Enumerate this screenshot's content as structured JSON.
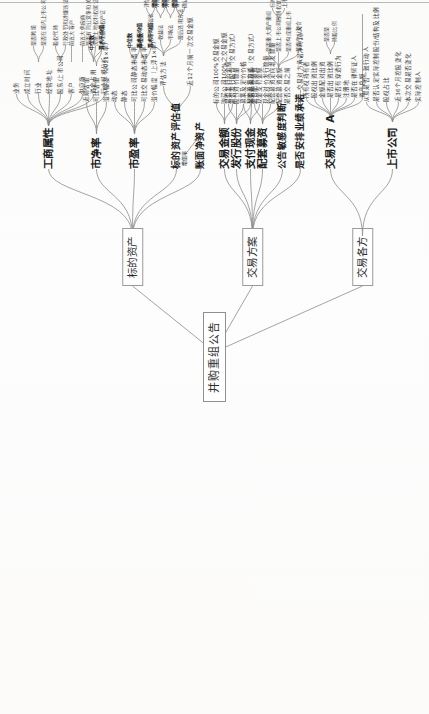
{
  "meta": {
    "orientation": "rotated-90-ccw",
    "stroke_color": "#8d8d8d",
    "text_color": "#2c2c2c",
    "background": "#fdfdfc"
  },
  "root": {
    "label": "并购重组公告"
  },
  "branches": [
    {
      "id": "biaodi",
      "label": "标的资产",
      "children": [
        {
          "label": "工商属性",
          "children": [
            {
              "label": "业务",
              "children": []
            },
            {
              "label": "成立时间",
              "children": []
            },
            {
              "label": "行业",
              "children": [
                {
                  "label": "是否跨境"
                },
                {
                  "label": "是否在境内上市公司范围所在境外"
                }
              ]
            },
            {
              "label": "经营地址",
              "children": []
            },
            {
              "label": "股东/上市公司",
              "children": [
                {
                  "label": "股权代持"
                },
                {
                  "label": "行政处罚和涉嫌违法"
                }
              ]
            },
            {
              "label": "客户",
              "children": [
                {
                  "label": "前五大客户"
                }
              ]
            },
            {
              "label": "供应商",
              "children": [
                {
                  "label": "前五大供应商"
                }
              ]
            },
            {
              "label": "资金占用",
              "children": [
                {
                  "label": "是否有同业竞争和关联解释"
                },
                {
                  "label": "房屋土地权利权属证书"
                },
                {
                  "label": "土地使用权产证"
                }
              ]
            },
            {
              "label": "行业规模分析",
              "children": []
            }
          ]
        },
        {
          "label": "市净率",
          "children": [
            {
              "label": "近期估值",
              "children": []
            },
            {
              "label": "可比估值",
              "children": [
                {
                  "label": "中位数"
                },
                {
                  "label": "算术平均值"
                }
              ]
            },
            {
              "label": "溢价幅度（2021×率）",
              "children": []
            }
          ]
        },
        {
          "label": "市盈率",
          "children": [
            {
              "label": "动态",
              "children": []
            },
            {
              "label": "静态",
              "children": []
            },
            {
              "label": "可比公司静态市盈率",
              "children": [
                {
                  "label": "中位数"
                },
                {
                  "label": "算术平均值"
                }
              ]
            },
            {
              "label": "可比交易动态市盈率",
              "children": [
                {
                  "label": "中位数"
                },
                {
                  "label": "算术平均值"
                }
              ]
            },
            {
              "label": "溢价幅度（上浮1×率）",
              "children": []
            }
          ]
        },
        {
          "label": "标的资产评估值",
          "children": [
            {
              "label": "评估方法",
              "children": [
                {
                  "label": "资产基础法",
                  "children": [
                    {
                      "label": "评估值"
                    },
                    {
                      "label": "增值率"
                    }
                  ]
                },
                {
                  "label": "收益法",
                  "children": [
                    {
                      "label": "评估值"
                    },
                    {
                      "label": "增值率"
                    }
                  ]
                },
                {
                  "label": "市场法",
                  "children": [
                    {
                      "label": "评估值"
                    },
                    {
                      "label": "增值率"
                    }
                  ]
                },
                {
                  "label": "最后选用方法",
                  "children": [
                    {
                      "label": "客户基础法"
                    },
                    {
                      "label": "确认评估值金额"
                    }
                  ]
                }
              ]
            },
            {
              "label": "近12个月前一次交易金额",
              "children": []
            }
          ]
        },
        {
          "label": "账面净资产",
          "annotation": "增值率",
          "children": []
        }
      ]
    },
    {
      "id": "fangan",
      "label": "交易方案",
      "children": [
        {
          "label": "交易金额",
          "children": [
            {
              "label": "标的公司100%交易金额"
            },
            {
              "label": "购买公司100%之交易金额"
            },
            {
              "label": "是否发行股份（交易方式）"
            }
          ]
        },
        {
          "label": "发行股份",
          "children": [
            {
              "label": "是否发行价金额"
            },
            {
              "label": "股份对价数量"
            },
            {
              "label": "募集及定价价格"
            },
            {
              "label": "配套募集方式"
            }
          ]
        },
        {
          "label": "支付现金",
          "children": [
            {
              "label": "是否支付现金（交易方式）"
            },
            {
              "label": "现金支付金额"
            },
            {
              "label": "现金对价发行数量"
            }
          ]
        },
        {
          "label": "配套募资",
          "children": [
            {
              "label": "是否配套募资"
            },
            {
              "label": "配套募资定向增发数量"
            },
            {
              "label": "配套募资金额"
            },
            {
              "label": "是否交易之前",
              "children": [
                {
                  "label": "是否重大资产重组"
                },
                {
                  "label": "是否上市公司控制权变化",
                  "children": [
                    {
                      "label": "标的公司计划募投"
                    },
                    {
                      "label": "上市公司往来金额"
                    }
                  ]
                },
                {
                  "label": "是否构成重组上市"
                },
                {
                  "label": "是否产业整合"
                }
              ]
            }
          ]
        },
        {
          "label": "公告敏感度判断",
          "children": []
        },
        {
          "label": "是否安排业绩承诺",
          "children": [
            {
              "label": "交易对方承诺净利润/人"
            }
          ]
        }
      ]
    },
    {
      "id": "gefang",
      "label": "交易各方",
      "children": [
        {
          "label": "交易对方 A",
          "children": [
            {
              "label": "所有权持有者"
            },
            {
              "label": "股权出资比例"
            },
            {
              "label": "金额配对出资"
            },
            {
              "label": "是否出资比例",
              "children": [
                {
                  "label": "是否是"
                },
                {
                  "label": "持股比例"
                }
              ]
            },
            {
              "label": "是否有穿透行为"
            },
            {
              "label": "注册地"
            },
            {
              "label": "是否在律师证人"
            },
            {
              "label": "资产总额"
            }
          ]
        },
        {
          "label": "上市公司",
          "children": [
            {
              "label": "从意是否一致行动人"
            },
            {
              "label": "是否认定实际控制股份/结构及比例"
            },
            {
              "label": "股权占比"
            },
            {
              "label": "近36个月控股变化"
            },
            {
              "label": "本次交易是否变化"
            },
            {
              "label": "实际控制人"
            }
          ]
        }
      ]
    }
  ]
}
